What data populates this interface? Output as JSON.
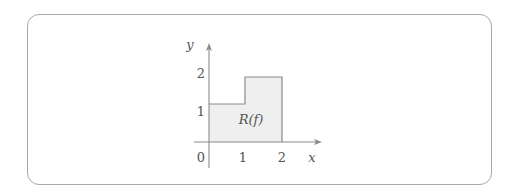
{
  "figure": {
    "axes": {
      "x_label": "x",
      "y_label": "y",
      "origin_label": "0",
      "x_ticks": [
        "1",
        "2"
      ],
      "y_ticks": [
        "1",
        "2"
      ]
    },
    "region": {
      "label": "R(f)",
      "fill_color": "#efefef",
      "stroke_color": "#8a8a8a",
      "steps": [
        {
          "x_from": 0,
          "x_to": 1,
          "height": 1
        },
        {
          "x_from": 1,
          "x_to": 2,
          "height": 2
        }
      ]
    }
  }
}
